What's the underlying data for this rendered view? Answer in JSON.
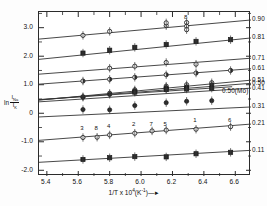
{
  "chart_data": {
    "type": "line",
    "title": "(Na,K)AlSi3O8",
    "title_parts": {
      "pre": "(Na,K)AlSi",
      "sub1": "3",
      "mid": "O",
      "sub2": "8"
    },
    "xlabel": "1/T x 10^4 (K^-1)",
    "xlabel_parts": {
      "pre": "1/T  x  10",
      "sup1": "4",
      "mid": "(K",
      "sup2": "-1",
      "post": ")"
    },
    "ylabel": "ln I_Na / I_K",
    "ylabel_parts": {
      "ln": "ln",
      "num": "I",
      "num_sub": "Na",
      "den": "I",
      "den_sub": "K"
    },
    "legend_title": "x_Na",
    "legend_title_parts": {
      "base": "x",
      "sub": "Na"
    },
    "legend_position": "right",
    "grid": false,
    "xlim": [
      5.35,
      6.7
    ],
    "ylim": [
      -2.2,
      3.55
    ],
    "xticks": [
      5.4,
      5.6,
      5.8,
      6.0,
      6.2,
      6.4,
      6.6
    ],
    "xtick_labels": [
      "5.4",
      "5.6",
      "5.8",
      "6.0",
      "6.2",
      "6.4",
      "6.6"
    ],
    "yticks": [
      3.0,
      2.0,
      1.0,
      0,
      -1.0,
      -2.0
    ],
    "ytick_labels": [
      "3.0",
      "2.0",
      "1.0",
      "0",
      "-1.0",
      "-2.0"
    ],
    "yminor": [
      3.5,
      2.5,
      1.5,
      0.5,
      -0.5,
      -1.5
    ],
    "series": [
      {
        "name": "0.90",
        "label": "0.90",
        "marker": "circle-open",
        "line": [
          [
            5.35,
            2.6
          ],
          [
            6.7,
            3.27
          ]
        ],
        "x": [
          5.63,
          5.8,
          6.16,
          6.16,
          6.29,
          6.29,
          6.29
        ],
        "y": [
          2.73,
          2.87,
          3.07,
          3.17,
          3.18,
          3.05,
          2.93
        ]
      },
      {
        "name": "0.81",
        "label": "0.81",
        "marker": "square-filled",
        "line": [
          [
            5.35,
            1.89
          ],
          [
            6.7,
            2.64
          ]
        ],
        "x": [
          5.63,
          5.8,
          5.96,
          6.16,
          6.35,
          6.57
        ],
        "y": [
          2.11,
          2.21,
          2.31,
          2.41,
          2.52,
          2.58
        ]
      },
      {
        "name": "0.71",
        "label": "0.71",
        "marker": "circle-open",
        "line": [
          [
            5.35,
            1.37
          ],
          [
            6.7,
            1.93
          ]
        ],
        "x": [
          5.8,
          5.96,
          6.16,
          6.35
        ],
        "y": [
          1.58,
          1.65,
          1.78,
          1.72
        ]
      },
      {
        "name": "0.61",
        "label": "0.61",
        "marker": "circle-half",
        "line": [
          [
            5.35,
            1.02
          ],
          [
            6.7,
            1.56
          ]
        ],
        "x": [
          5.63,
          5.8,
          5.96,
          6.16,
          6.35,
          6.57
        ],
        "y": [
          1.13,
          1.19,
          1.26,
          1.35,
          1.41,
          1.5
        ]
      },
      {
        "name": "0.51",
        "label": "0.51",
        "marker": "circle-open",
        "line": [
          [
            5.35,
            0.46
          ],
          [
            6.7,
            1.16
          ]
        ],
        "x": [
          5.63,
          5.8,
          5.96,
          6.16,
          6.29,
          6.45
        ],
        "y": [
          0.58,
          0.7,
          0.82,
          0.95,
          1.0,
          1.07
        ]
      },
      {
        "name": "0.50",
        "label": "0.50",
        "marker": "circle-filled",
        "line": [
          [
            5.35,
            0.47
          ],
          [
            6.7,
            1.05
          ]
        ],
        "x": [
          5.63,
          5.8,
          5.96,
          6.16,
          6.29,
          6.45
        ],
        "y": [
          0.56,
          0.66,
          0.78,
          0.9,
          0.93,
          1.0
        ]
      },
      {
        "name": "0.50-Mo",
        "label": "0.50(Mo)",
        "marker": "circle-filled",
        "line": [
          [
            5.35,
            0.48
          ],
          [
            6.58,
            0.93
          ]
        ],
        "x": [
          5.96,
          6.16,
          6.29
        ],
        "y": [
          0.76,
          0.86,
          0.89
        ]
      },
      {
        "name": "0.41",
        "label": "0.41",
        "marker": "square-filled",
        "line": [
          [
            5.35,
            0.4
          ],
          [
            6.7,
            0.88
          ]
        ],
        "x": [
          5.96,
          6.16,
          6.29,
          6.45
        ],
        "y": [
          0.74,
          0.83,
          0.85,
          0.88
        ]
      },
      {
        "name": "0.31",
        "label": "0.31",
        "marker": "circle-filled",
        "line": [
          [
            5.35,
            -0.13
          ],
          [
            6.7,
            0.22
          ]
        ],
        "x": [
          5.63,
          5.8,
          5.96,
          6.16,
          6.29,
          6.45
        ],
        "y": [
          0.13,
          0.12,
          0.27,
          0.37,
          0.42,
          0.44
        ]
      },
      {
        "name": "0.21",
        "label": "0.21",
        "marker": "circle-open",
        "line": [
          [
            5.35,
            -0.95
          ],
          [
            6.7,
            -0.38
          ]
        ],
        "x": [
          5.63,
          5.72,
          5.8,
          5.96,
          6.07,
          6.16,
          6.35,
          6.57
        ],
        "y": [
          -0.85,
          -0.84,
          -0.76,
          -0.7,
          -0.62,
          -0.59,
          -0.56,
          -0.47
        ],
        "point_numbers": [
          "3",
          "8",
          "4",
          "2",
          "7",
          "5",
          "1",
          "6"
        ]
      },
      {
        "name": "0.11",
        "label": "0.11",
        "marker": "square-filled",
        "line": [
          [
            5.35,
            -1.72
          ],
          [
            6.7,
            -1.3
          ]
        ],
        "x": [
          5.63,
          5.8,
          5.96,
          6.16,
          6.35,
          6.57
        ],
        "y": [
          -1.62,
          -1.56,
          -1.52,
          -1.53,
          -1.42,
          -1.37
        ]
      }
    ],
    "extra_point_labels": [
      {
        "text": "8",
        "x": 6.29,
        "y": 3.3
      },
      {
        "text": "2",
        "x": 5.96,
        "y": -0.44
      },
      {
        "text": "7",
        "x": 6.07,
        "y": -0.44
      },
      {
        "text": "5",
        "x": 6.16,
        "y": -0.44
      },
      {
        "text": "1",
        "x": 6.35,
        "y": -0.32
      },
      {
        "text": "6",
        "x": 6.57,
        "y": -0.32
      },
      {
        "text": "3",
        "x": 5.63,
        "y": -0.58
      },
      {
        "text": "8",
        "x": 5.72,
        "y": -0.58
      },
      {
        "text": "4",
        "x": 5.8,
        "y": -0.5
      }
    ],
    "colors": {
      "axis": "#2b2b2b",
      "line": "#333333",
      "marker": "#222222",
      "background": "#ffffff"
    }
  }
}
